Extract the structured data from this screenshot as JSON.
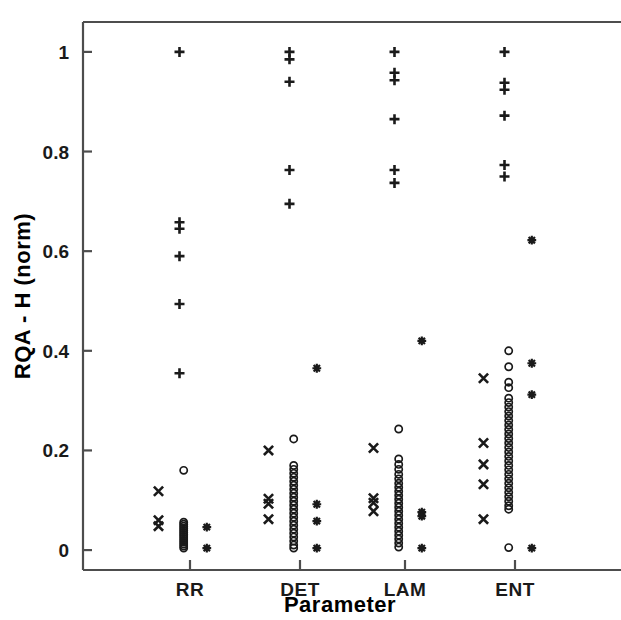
{
  "chart_data": {
    "type": "scatter",
    "title": "",
    "xlabel": "Parameter",
    "ylabel": "RQA - H (norm)",
    "categories": [
      "RR",
      "DET",
      "LAM",
      "ENT"
    ],
    "ylim": [
      -0.04,
      1.06
    ],
    "yticks": [
      0,
      0.2,
      0.4,
      0.6,
      0.8,
      1
    ],
    "ytick_labels": [
      "0",
      "0.2",
      "0.4",
      "0.6",
      "0.8",
      "1"
    ],
    "grid": false,
    "legend": "none",
    "marker_types": [
      "x-mark",
      "circle",
      "plus",
      "asterisk"
    ],
    "series": [
      {
        "name": "x-mark",
        "marker": "x",
        "points": [
          {
            "category": "RR",
            "offset": -0.3,
            "value": 0.118
          },
          {
            "category": "RR",
            "offset": -0.3,
            "value": 0.06
          },
          {
            "category": "RR",
            "offset": -0.3,
            "value": 0.048
          },
          {
            "category": "DET",
            "offset": -0.3,
            "value": 0.2
          },
          {
            "category": "DET",
            "offset": -0.3,
            "value": 0.103
          },
          {
            "category": "DET",
            "offset": -0.3,
            "value": 0.093
          },
          {
            "category": "DET",
            "offset": -0.3,
            "value": 0.062
          },
          {
            "category": "LAM",
            "offset": -0.3,
            "value": 0.205
          },
          {
            "category": "LAM",
            "offset": -0.3,
            "value": 0.104
          },
          {
            "category": "LAM",
            "offset": -0.3,
            "value": 0.095
          },
          {
            "category": "LAM",
            "offset": -0.3,
            "value": 0.078
          },
          {
            "category": "ENT",
            "offset": -0.3,
            "value": 0.345
          },
          {
            "category": "ENT",
            "offset": -0.3,
            "value": 0.215
          },
          {
            "category": "ENT",
            "offset": -0.3,
            "value": 0.172
          },
          {
            "category": "ENT",
            "offset": -0.3,
            "value": 0.132
          },
          {
            "category": "ENT",
            "offset": -0.3,
            "value": 0.062
          }
        ]
      },
      {
        "name": "circle",
        "marker": "o",
        "points": [
          {
            "category": "RR",
            "offset": -0.06,
            "value": 0.16
          },
          {
            "category": "RR",
            "offset": -0.06,
            "value": 0.056
          },
          {
            "category": "RR",
            "offset": -0.06,
            "value": 0.052
          },
          {
            "category": "RR",
            "offset": -0.06,
            "value": 0.048
          },
          {
            "category": "RR",
            "offset": -0.06,
            "value": 0.044
          },
          {
            "category": "RR",
            "offset": -0.06,
            "value": 0.04
          },
          {
            "category": "RR",
            "offset": -0.06,
            "value": 0.036
          },
          {
            "category": "RR",
            "offset": -0.06,
            "value": 0.032
          },
          {
            "category": "RR",
            "offset": -0.06,
            "value": 0.028
          },
          {
            "category": "RR",
            "offset": -0.06,
            "value": 0.024
          },
          {
            "category": "RR",
            "offset": -0.06,
            "value": 0.02
          },
          {
            "category": "RR",
            "offset": -0.06,
            "value": 0.016
          },
          {
            "category": "RR",
            "offset": -0.06,
            "value": 0.012
          },
          {
            "category": "RR",
            "offset": -0.06,
            "value": 0.008
          },
          {
            "category": "RR",
            "offset": -0.06,
            "value": 0.004
          },
          {
            "category": "DET",
            "offset": -0.06,
            "value": 0.223
          },
          {
            "category": "DET",
            "offset": -0.06,
            "value": 0.17
          },
          {
            "category": "DET",
            "offset": -0.06,
            "value": 0.162
          },
          {
            "category": "DET",
            "offset": -0.06,
            "value": 0.154
          },
          {
            "category": "DET",
            "offset": -0.06,
            "value": 0.146
          },
          {
            "category": "DET",
            "offset": -0.06,
            "value": 0.138
          },
          {
            "category": "DET",
            "offset": -0.06,
            "value": 0.13
          },
          {
            "category": "DET",
            "offset": -0.06,
            "value": 0.122
          },
          {
            "category": "DET",
            "offset": -0.06,
            "value": 0.114
          },
          {
            "category": "DET",
            "offset": -0.06,
            "value": 0.106
          },
          {
            "category": "DET",
            "offset": -0.06,
            "value": 0.098
          },
          {
            "category": "DET",
            "offset": -0.06,
            "value": 0.09
          },
          {
            "category": "DET",
            "offset": -0.06,
            "value": 0.082
          },
          {
            "category": "DET",
            "offset": -0.06,
            "value": 0.074
          },
          {
            "category": "DET",
            "offset": -0.06,
            "value": 0.066
          },
          {
            "category": "DET",
            "offset": -0.06,
            "value": 0.058
          },
          {
            "category": "DET",
            "offset": -0.06,
            "value": 0.05
          },
          {
            "category": "DET",
            "offset": -0.06,
            "value": 0.042
          },
          {
            "category": "DET",
            "offset": -0.06,
            "value": 0.034
          },
          {
            "category": "DET",
            "offset": -0.06,
            "value": 0.026
          },
          {
            "category": "DET",
            "offset": -0.06,
            "value": 0.018
          },
          {
            "category": "DET",
            "offset": -0.06,
            "value": 0.01
          },
          {
            "category": "DET",
            "offset": -0.06,
            "value": 0.004
          },
          {
            "category": "LAM",
            "offset": -0.06,
            "value": 0.243
          },
          {
            "category": "LAM",
            "offset": -0.06,
            "value": 0.183
          },
          {
            "category": "LAM",
            "offset": -0.06,
            "value": 0.172
          },
          {
            "category": "LAM",
            "offset": -0.06,
            "value": 0.162
          },
          {
            "category": "LAM",
            "offset": -0.06,
            "value": 0.152
          },
          {
            "category": "LAM",
            "offset": -0.06,
            "value": 0.143
          },
          {
            "category": "LAM",
            "offset": -0.06,
            "value": 0.134
          },
          {
            "category": "LAM",
            "offset": -0.06,
            "value": 0.126
          },
          {
            "category": "LAM",
            "offset": -0.06,
            "value": 0.118
          },
          {
            "category": "LAM",
            "offset": -0.06,
            "value": 0.11
          },
          {
            "category": "LAM",
            "offset": -0.06,
            "value": 0.102
          },
          {
            "category": "LAM",
            "offset": -0.06,
            "value": 0.094
          },
          {
            "category": "LAM",
            "offset": -0.06,
            "value": 0.086
          },
          {
            "category": "LAM",
            "offset": -0.06,
            "value": 0.078
          },
          {
            "category": "LAM",
            "offset": -0.06,
            "value": 0.07
          },
          {
            "category": "LAM",
            "offset": -0.06,
            "value": 0.062
          },
          {
            "category": "LAM",
            "offset": -0.06,
            "value": 0.054
          },
          {
            "category": "LAM",
            "offset": -0.06,
            "value": 0.046
          },
          {
            "category": "LAM",
            "offset": -0.06,
            "value": 0.038
          },
          {
            "category": "LAM",
            "offset": -0.06,
            "value": 0.03
          },
          {
            "category": "LAM",
            "offset": -0.06,
            "value": 0.022
          },
          {
            "category": "LAM",
            "offset": -0.06,
            "value": 0.014
          },
          {
            "category": "LAM",
            "offset": -0.06,
            "value": 0.006
          },
          {
            "category": "ENT",
            "offset": -0.06,
            "value": 0.4
          },
          {
            "category": "ENT",
            "offset": -0.06,
            "value": 0.368
          },
          {
            "category": "ENT",
            "offset": -0.06,
            "value": 0.337
          },
          {
            "category": "ENT",
            "offset": -0.06,
            "value": 0.326
          },
          {
            "category": "ENT",
            "offset": -0.06,
            "value": 0.305
          },
          {
            "category": "ENT",
            "offset": -0.06,
            "value": 0.296
          },
          {
            "category": "ENT",
            "offset": -0.06,
            "value": 0.287
          },
          {
            "category": "ENT",
            "offset": -0.06,
            "value": 0.278
          },
          {
            "category": "ENT",
            "offset": -0.06,
            "value": 0.269
          },
          {
            "category": "ENT",
            "offset": -0.06,
            "value": 0.26
          },
          {
            "category": "ENT",
            "offset": -0.06,
            "value": 0.251
          },
          {
            "category": "ENT",
            "offset": -0.06,
            "value": 0.242
          },
          {
            "category": "ENT",
            "offset": -0.06,
            "value": 0.233
          },
          {
            "category": "ENT",
            "offset": -0.06,
            "value": 0.224
          },
          {
            "category": "ENT",
            "offset": -0.06,
            "value": 0.215
          },
          {
            "category": "ENT",
            "offset": -0.06,
            "value": 0.206
          },
          {
            "category": "ENT",
            "offset": -0.06,
            "value": 0.197
          },
          {
            "category": "ENT",
            "offset": -0.06,
            "value": 0.188
          },
          {
            "category": "ENT",
            "offset": -0.06,
            "value": 0.179
          },
          {
            "category": "ENT",
            "offset": -0.06,
            "value": 0.17
          },
          {
            "category": "ENT",
            "offset": -0.06,
            "value": 0.161
          },
          {
            "category": "ENT",
            "offset": -0.06,
            "value": 0.152
          },
          {
            "category": "ENT",
            "offset": -0.06,
            "value": 0.143
          },
          {
            "category": "ENT",
            "offset": -0.06,
            "value": 0.134
          },
          {
            "category": "ENT",
            "offset": -0.06,
            "value": 0.125
          },
          {
            "category": "ENT",
            "offset": -0.06,
            "value": 0.116
          },
          {
            "category": "ENT",
            "offset": -0.06,
            "value": 0.107
          },
          {
            "category": "ENT",
            "offset": -0.06,
            "value": 0.098
          },
          {
            "category": "ENT",
            "offset": -0.06,
            "value": 0.089
          },
          {
            "category": "ENT",
            "offset": -0.06,
            "value": 0.082
          },
          {
            "category": "ENT",
            "offset": -0.06,
            "value": 0.005
          }
        ]
      },
      {
        "name": "plus",
        "marker": "+",
        "points": [
          {
            "category": "RR",
            "offset": -0.1,
            "value": 1.0
          },
          {
            "category": "RR",
            "offset": -0.1,
            "value": 0.658
          },
          {
            "category": "RR",
            "offset": -0.1,
            "value": 0.645
          },
          {
            "category": "RR",
            "offset": -0.1,
            "value": 0.59
          },
          {
            "category": "RR",
            "offset": -0.1,
            "value": 0.494
          },
          {
            "category": "RR",
            "offset": -0.1,
            "value": 0.355
          },
          {
            "category": "DET",
            "offset": -0.1,
            "value": 1.0
          },
          {
            "category": "DET",
            "offset": -0.1,
            "value": 0.985
          },
          {
            "category": "DET",
            "offset": -0.1,
            "value": 0.94
          },
          {
            "category": "DET",
            "offset": -0.1,
            "value": 0.763
          },
          {
            "category": "DET",
            "offset": -0.1,
            "value": 0.695
          },
          {
            "category": "LAM",
            "offset": -0.1,
            "value": 1.0
          },
          {
            "category": "LAM",
            "offset": -0.1,
            "value": 0.958
          },
          {
            "category": "LAM",
            "offset": -0.1,
            "value": 0.943
          },
          {
            "category": "LAM",
            "offset": -0.1,
            "value": 0.865
          },
          {
            "category": "LAM",
            "offset": -0.1,
            "value": 0.763
          },
          {
            "category": "LAM",
            "offset": -0.1,
            "value": 0.737
          },
          {
            "category": "ENT",
            "offset": -0.1,
            "value": 1.0
          },
          {
            "category": "ENT",
            "offset": -0.1,
            "value": 0.938
          },
          {
            "category": "ENT",
            "offset": -0.1,
            "value": 0.924
          },
          {
            "category": "ENT",
            "offset": -0.1,
            "value": 0.872
          },
          {
            "category": "ENT",
            "offset": -0.1,
            "value": 0.773
          },
          {
            "category": "ENT",
            "offset": -0.1,
            "value": 0.75
          }
        ]
      },
      {
        "name": "asterisk",
        "marker": "*",
        "points": [
          {
            "category": "RR",
            "offset": 0.16,
            "value": 0.046
          },
          {
            "category": "RR",
            "offset": 0.16,
            "value": 0.004
          },
          {
            "category": "DET",
            "offset": 0.16,
            "value": 0.365
          },
          {
            "category": "DET",
            "offset": 0.16,
            "value": 0.092
          },
          {
            "category": "DET",
            "offset": 0.16,
            "value": 0.058
          },
          {
            "category": "DET",
            "offset": 0.16,
            "value": 0.004
          },
          {
            "category": "LAM",
            "offset": 0.16,
            "value": 0.42
          },
          {
            "category": "LAM",
            "offset": 0.16,
            "value": 0.076
          },
          {
            "category": "LAM",
            "offset": 0.16,
            "value": 0.068
          },
          {
            "category": "LAM",
            "offset": 0.16,
            "value": 0.004
          },
          {
            "category": "ENT",
            "offset": 0.16,
            "value": 0.622
          },
          {
            "category": "ENT",
            "offset": 0.16,
            "value": 0.375
          },
          {
            "category": "ENT",
            "offset": 0.16,
            "value": 0.312
          },
          {
            "category": "ENT",
            "offset": 0.16,
            "value": 0.004
          }
        ]
      }
    ]
  }
}
